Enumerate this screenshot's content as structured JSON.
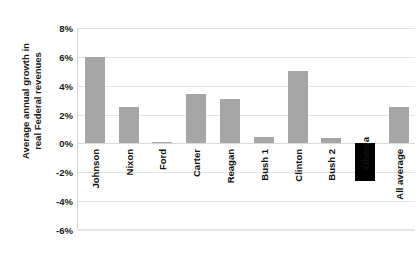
{
  "chart_data": {
    "type": "bar",
    "title": "",
    "title_remnant": "",
    "xlabel": "",
    "ylabel": "Average annual growth in real Federal revenues",
    "ylabel_lines": [
      "Average annual growth in",
      "real Federal revenues"
    ],
    "categories": [
      "Johnson",
      "Nixon",
      "Ford",
      "Carter",
      "Reagan",
      "Bush 1",
      "Clinton",
      "Bush 2",
      "Obama",
      "All average"
    ],
    "values": [
      6.0,
      2.5,
      0.1,
      3.45,
      3.1,
      0.45,
      5.05,
      0.35,
      -2.6,
      2.55
    ],
    "value_unit": "%",
    "ylim": [
      -6,
      8
    ],
    "yticks": [
      8,
      6,
      4,
      2,
      0,
      -2,
      -4,
      -6
    ],
    "ytick_labels": [
      "8%",
      "6%",
      "4%",
      "2%",
      "0%",
      "-2%",
      "-4%",
      "-6%"
    ],
    "grid": true,
    "legend": false,
    "bar_colors": [
      "#a6a6a6",
      "#a6a6a6",
      "#a6a6a6",
      "#a6a6a6",
      "#a6a6a6",
      "#a6a6a6",
      "#a6a6a6",
      "#a6a6a6",
      "#000000",
      "#a6a6a6"
    ],
    "highlight_category": "Obama",
    "highlight_color": "#000000",
    "default_color": "#a6a6a6"
  }
}
